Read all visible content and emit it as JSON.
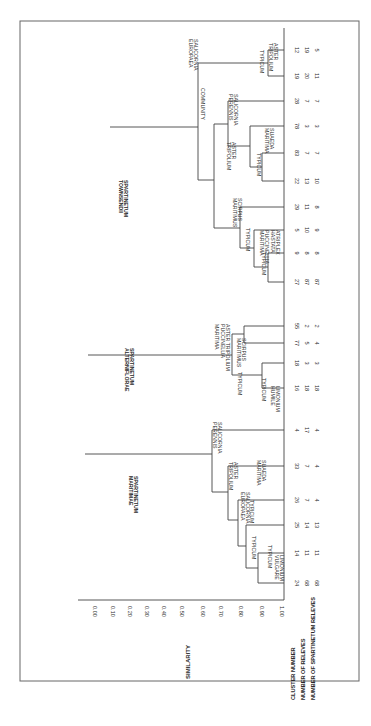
{
  "chart_data": {
    "type": "dendrogram",
    "orientation": "rotated-90-clockwise",
    "ylabel": "SIMILARITY",
    "axis_ticks": [
      "0.00",
      "0.10",
      "0.20",
      "0.30",
      "0.40",
      "0.50",
      "0.60",
      "0.70",
      "0.80",
      "0.90",
      "1.00"
    ],
    "row_labels": [
      "CLUSTER NUMBER",
      "NUMBER OF RELEVES",
      "NUMBER OF SPARTINETUM RELEVES"
    ],
    "leaves": [
      {
        "cluster": "24",
        "releves": "68",
        "spartinetum": "68"
      },
      {
        "cluster": "14",
        "releves": "11",
        "spartinetum": "11"
      },
      {
        "cluster": "25",
        "releves": "14",
        "spartinetum": "13"
      },
      {
        "cluster": "26",
        "releves": "7",
        "spartinetum": "4"
      },
      {
        "cluster": "33",
        "releves": "7",
        "spartinetum": "4"
      },
      {
        "cluster": "4",
        "releves": "17",
        "spartinetum": "4"
      },
      {
        "cluster": "16",
        "releves": "18",
        "spartinetum": "18"
      },
      {
        "cluster": "18",
        "releves": "3",
        "spartinetum": "3"
      },
      {
        "cluster": "77",
        "releves": "5",
        "spartinetum": "4"
      },
      {
        "cluster": "55",
        "releves": "2",
        "spartinetum": "2"
      },
      {
        "cluster": "27",
        "releves": "87",
        "spartinetum": "87"
      },
      {
        "cluster": "9",
        "releves": "8",
        "spartinetum": "8"
      },
      {
        "cluster": "5",
        "releves": "10",
        "spartinetum": "9"
      },
      {
        "cluster": "29",
        "releves": "11",
        "spartinetum": "8"
      },
      {
        "cluster": "22",
        "releves": "13",
        "spartinetum": "10"
      },
      {
        "cluster": "83",
        "releves": "7",
        "spartinetum": "7"
      },
      {
        "cluster": "78",
        "releves": "3",
        "spartinetum": "3"
      },
      {
        "cluster": "28",
        "releves": "7",
        "spartinetum": "7"
      },
      {
        "cluster": "19",
        "releves": "20",
        "spartinetum": "11"
      },
      {
        "cluster": "12",
        "releves": "19",
        "spartinetum": "5"
      }
    ],
    "groups": [
      {
        "name": "SPARTINETUM MARITIMAE",
        "lines": [
          "SPARTINETUM",
          "MARITIMAE"
        ]
      },
      {
        "name": "SPARTINETUM ALTERNIFLORAE",
        "lines": [
          "SPARTINETUM",
          "ALTERNIFLORAE"
        ]
      },
      {
        "name": "SPARTINETUM TOWNSENDII",
        "lines": [
          "SPARTINETUM",
          "TOWNSENDII"
        ]
      }
    ],
    "node_labels": {
      "m_typicum_a": [
        "TYPICUM"
      ],
      "m_typicum_b": [
        "TYPICUM"
      ],
      "m_limonium_vulgare": [
        "LIMONIUM",
        "VULGARE"
      ],
      "m_typicum_c": [
        "TYPICUM"
      ],
      "m_suaeda": [
        "SUAEDA",
        "MARITIMA"
      ],
      "m_salicornia_europaea": [
        "SALICORNIA",
        "EUROPAEA"
      ],
      "m_aster": [
        "ASTER",
        "TRIPOLIUM"
      ],
      "m_salicornia_perennis": [
        "SALICORNIA",
        "PERENNIS"
      ],
      "a_typicum": [
        "TYPICUM"
      ],
      "a_typicum_b": [
        "TYPICUM"
      ],
      "a_limonium_humile": [
        "LIMONIUM",
        "HUMILE"
      ],
      "a_scirpus": [
        "SCIRPUS",
        "MARITIMUS"
      ],
      "a_aster_pucc": [
        "ASTER TRIPOLIUM",
        "PUCCINELLIA",
        "MARITIMA"
      ],
      "t_typicum": [
        "TYPICUM"
      ],
      "t_typicum_b": [
        "TYPICUM"
      ],
      "t_atriplex": [
        "ATRIPLEX",
        "HASTATA",
        "PUCCINELLIA",
        "MARITIMA"
      ],
      "t_scirpus": [
        "SCIRPUS",
        "MARITIMUS"
      ],
      "t_aster": [
        "ASTER",
        "TRIPOLIUM"
      ],
      "t_typicum_c": [
        "TYPICUM"
      ],
      "t_suaeda": [
        "SUAEDA",
        "MARITIMA"
      ],
      "t_community": [
        "COMMUNITY"
      ],
      "t_salicornia_perennis": [
        "SALICORNIA",
        "PERENNIS"
      ],
      "t_salicornia_europaea": [
        "SALICORNIA",
        "EUROPAEA"
      ],
      "t_typicum_d": [
        "TYPICUM"
      ],
      "t_aster_b": [
        "ASTER",
        "TRIPOLIUM"
      ]
    }
  }
}
